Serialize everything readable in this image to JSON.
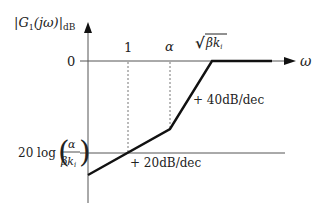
{
  "diagram": {
    "type": "bode-magnitude-asymptote",
    "y_axis_label": {
      "main": "|G",
      "sub1": "1",
      "paren": "(jω)|",
      "sub2": "dB"
    },
    "x_axis_label": "ω",
    "y_ticks": {
      "zero": "0",
      "low_prefix": "20 log",
      "low_num": "α",
      "low_den": "βk",
      "low_den_sub": "i"
    },
    "x_markers": {
      "one": "1",
      "alpha": "α",
      "sqrt_prefix": "√",
      "sqrt_body": "βk",
      "sqrt_sub": "i"
    },
    "slopes": {
      "first": "+ 20dB/dec",
      "second": "+ 40dB/dec"
    },
    "colors": {
      "axis": "#555555",
      "asymptote": "#111111",
      "dashed": "#666666",
      "text": "#222222"
    }
  }
}
